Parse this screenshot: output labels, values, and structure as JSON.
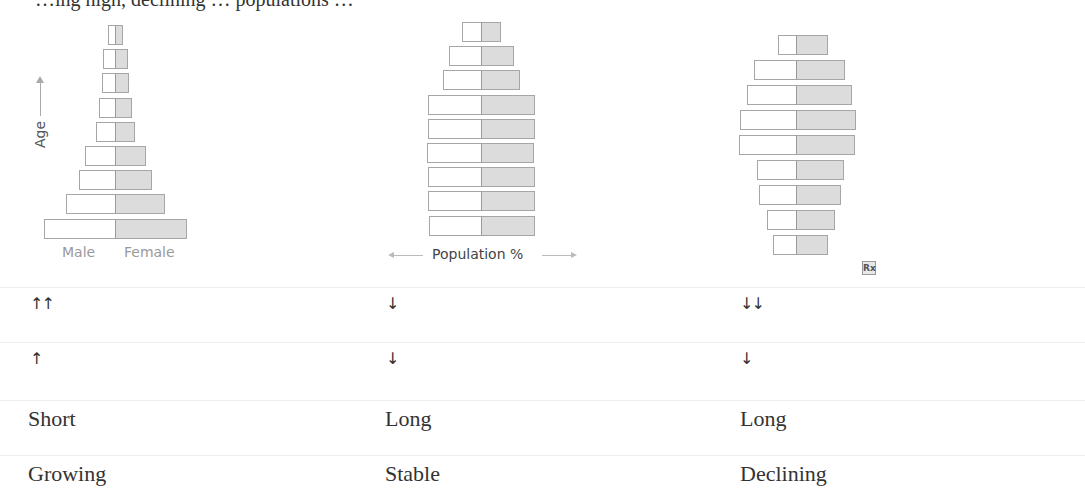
{
  "header": {
    "cut_text": "…ing high, declining … populations …"
  },
  "chart_data": [
    {
      "type": "bar",
      "title": "Growing population pyramid",
      "orientation": "horizontal-population-pyramid",
      "xlabel": "",
      "ylabel": "Age",
      "legend": [
        "Male",
        "Female"
      ],
      "categories": [
        "age-9",
        "age-8",
        "age-7",
        "age-6",
        "age-5",
        "age-4",
        "age-3",
        "age-2",
        "age-1"
      ],
      "series": [
        {
          "name": "Male",
          "values": [
            7,
            12,
            13,
            16,
            19,
            30,
            36,
            49,
            71
          ]
        },
        {
          "name": "Female",
          "values": [
            7,
            12,
            13,
            16,
            19,
            30,
            36,
            49,
            71
          ]
        }
      ]
    },
    {
      "type": "bar",
      "title": "Stable population pyramid",
      "orientation": "horizontal-population-pyramid",
      "xlabel": "Population %",
      "ylabel": "",
      "categories": [
        "age-9",
        "age-8",
        "age-7",
        "age-6",
        "age-5",
        "age-4",
        "age-3",
        "age-2",
        "age-1"
      ],
      "series": [
        {
          "name": "Male",
          "values": [
            19,
            32,
            38,
            53,
            53,
            54,
            53,
            53,
            52
          ]
        },
        {
          "name": "Female",
          "values": [
            19,
            32,
            38,
            53,
            53,
            52,
            53,
            53,
            53
          ]
        }
      ]
    },
    {
      "type": "bar",
      "title": "Declining population pyramid",
      "orientation": "horizontal-population-pyramid",
      "xlabel": "",
      "ylabel": "",
      "categories": [
        "age-9",
        "age-8",
        "age-7",
        "age-6",
        "age-5",
        "age-4",
        "age-3",
        "age-2",
        "age-1"
      ],
      "series": [
        {
          "name": "Male",
          "values": [
            18,
            42,
            49,
            56,
            57,
            39,
            37,
            29,
            23
          ]
        },
        {
          "name": "Female",
          "values": [
            31,
            48,
            55,
            59,
            58,
            47,
            44,
            38,
            31
          ]
        }
      ]
    }
  ],
  "pyramids": [
    {
      "center_x": 115,
      "top_y": 25,
      "pitch": 24.2,
      "male": [
        7,
        12,
        13,
        16,
        19,
        30,
        36,
        49,
        71
      ],
      "female": [
        7,
        12,
        13,
        16,
        19,
        30,
        36,
        49,
        71
      ]
    },
    {
      "center_x": 481,
      "top_y": 22,
      "pitch": 24.2,
      "male": [
        19,
        32,
        38,
        53,
        53,
        54,
        53,
        53,
        52
      ],
      "female": [
        19,
        32,
        38,
        53,
        53,
        52,
        53,
        53,
        53
      ]
    },
    {
      "center_x": 796,
      "top_y": 35,
      "pitch": 25,
      "male": [
        18,
        42,
        49,
        56,
        57,
        39,
        37,
        29,
        23
      ],
      "female": [
        31,
        48,
        55,
        59,
        58,
        47,
        44,
        38,
        31
      ]
    }
  ],
  "labels": {
    "age": "Age",
    "male": "Male",
    "female": "Female",
    "population": "Population %",
    "rx_icon": "Rx"
  },
  "rows": [
    {
      "cells": [
        "↑↑",
        "↓",
        "↓↓"
      ]
    },
    {
      "cells": [
        "↑",
        "↓",
        "↓"
      ]
    },
    {
      "cells": [
        "Short",
        "Long",
        "Long"
      ]
    },
    {
      "cells": [
        "Growing",
        "Stable",
        "Declining"
      ]
    }
  ],
  "colors": {
    "female_fill": "#dcdcdc",
    "male_fill": "#ffffff",
    "bar_border": "#a6a6a6",
    "row_separator": "#eeeeee"
  }
}
